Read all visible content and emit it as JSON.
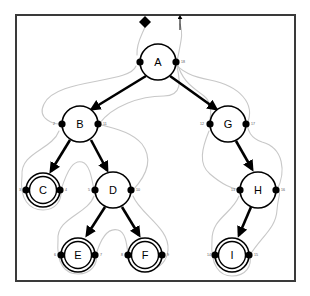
{
  "figure": {
    "background_color": "#ffffff",
    "border_color": "#3a3a3a",
    "tree_edge_color": "#000000",
    "tour_path_color": "#c8c8c8",
    "port_dot_color": "#000000",
    "port_number_color": "#555555"
  },
  "markers": {
    "start_marker": "diamond-start-marker",
    "end_marker": "arrow-end-marker"
  },
  "nodes": [
    {
      "id": "A",
      "label": "A",
      "cx": 158,
      "cy": 62,
      "r": 18,
      "double": false,
      "left_port": null,
      "right_port": "18"
    },
    {
      "id": "B",
      "label": "B",
      "cx": 80,
      "cy": 124,
      "r": 18,
      "double": false,
      "left_port": "2",
      "right_port": "11"
    },
    {
      "id": "G",
      "label": "G",
      "cx": 228,
      "cy": 124,
      "r": 18,
      "double": false,
      "left_port": "12",
      "right_port": "17"
    },
    {
      "id": "C",
      "label": "C",
      "cx": 43,
      "cy": 190,
      "r": 17,
      "double": true,
      "left_port": "3",
      "right_port": "4"
    },
    {
      "id": "D",
      "label": "D",
      "cx": 113,
      "cy": 190,
      "r": 18,
      "double": false,
      "left_port": "5",
      "right_port": "10"
    },
    {
      "id": "H",
      "label": "H",
      "cx": 258,
      "cy": 190,
      "r": 18,
      "double": false,
      "left_port": "13",
      "right_port": "16"
    },
    {
      "id": "E",
      "label": "E",
      "cx": 78,
      "cy": 255,
      "r": 17,
      "double": true,
      "left_port": "6",
      "right_port": "7"
    },
    {
      "id": "F",
      "label": "F",
      "cx": 145,
      "cy": 255,
      "r": 17,
      "double": true,
      "left_port": "8",
      "right_port": "9"
    },
    {
      "id": "I",
      "label": "I",
      "cx": 232,
      "cy": 255,
      "r": 17,
      "double": true,
      "left_port": "14",
      "right_port": "15"
    }
  ],
  "edges": [
    {
      "from": "A",
      "to": "B"
    },
    {
      "from": "A",
      "to": "G"
    },
    {
      "from": "B",
      "to": "C"
    },
    {
      "from": "B",
      "to": "D"
    },
    {
      "from": "D",
      "to": "E"
    },
    {
      "from": "D",
      "to": "F"
    },
    {
      "from": "G",
      "to": "H"
    },
    {
      "from": "H",
      "to": "I"
    }
  ],
  "tour_sequence": [
    "1",
    "2",
    "3",
    "4",
    "5",
    "6",
    "7",
    "8",
    "9",
    "10",
    "11",
    "12",
    "13",
    "14",
    "15",
    "16",
    "17",
    "18"
  ]
}
